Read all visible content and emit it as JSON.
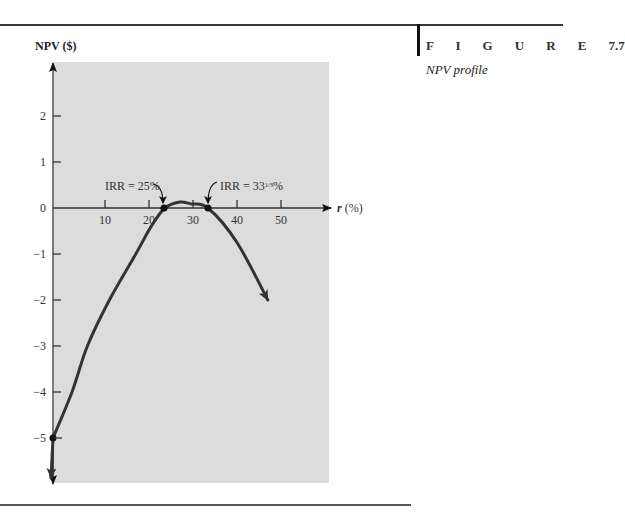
{
  "figure": {
    "label": "F I G U R E",
    "number": "7.7",
    "caption": "NPV profile"
  },
  "chart_data": {
    "type": "line",
    "title": "NPV profile",
    "xlabel_var": "r",
    "xlabel_unit": "(%)",
    "ylabel": "NPV ($)",
    "xlim": [
      0,
      55
    ],
    "ylim": [
      -5.5,
      3
    ],
    "x_ticks": [
      10,
      20,
      30,
      40,
      50
    ],
    "y_ticks": [
      2,
      1,
      0,
      -1,
      -2,
      -3,
      -4,
      -5
    ],
    "grid": false,
    "legend": null,
    "background": "#dcdcdc",
    "line_color": "#333333",
    "series": [
      {
        "name": "NPV",
        "x": [
          0,
          2.5,
          6,
          11,
          17,
          20.5,
          23.6,
          27,
          29.5,
          33.4,
          40,
          47
        ],
        "y": [
          -5,
          -4,
          -3,
          -2,
          -1,
          -0.4,
          0,
          0.13,
          0.09,
          0,
          -0.75,
          -2.0
        ]
      }
    ],
    "key_points": [
      {
        "x": 0,
        "y": -5,
        "label": ""
      },
      {
        "x": 25,
        "y": 0,
        "label": "IRR = 25%"
      },
      {
        "x": 33.33,
        "y": 0,
        "label": "IRR = 33⅓%"
      }
    ],
    "annotations": [
      {
        "text": "IRR = 25%",
        "points_to": "25"
      },
      {
        "text": "IRR = 33",
        "fraction": "1/3",
        "suffix": "%",
        "points_to": "33⅓"
      }
    ]
  }
}
